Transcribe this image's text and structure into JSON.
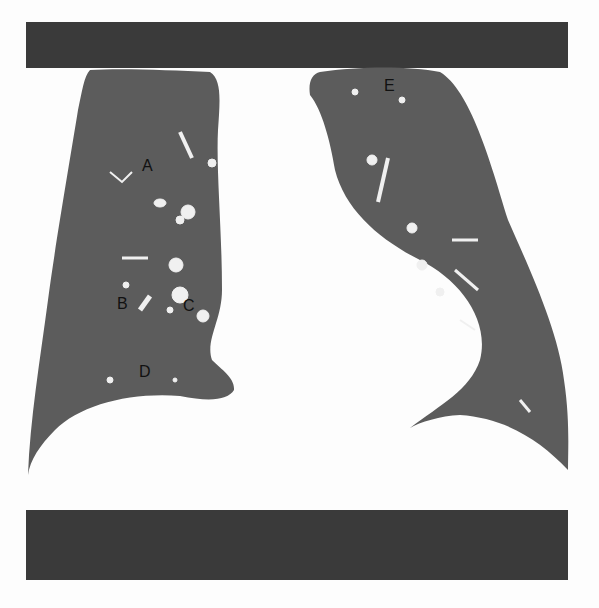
{
  "image": {
    "description": "Coronal CT lung window showing right and left lungs with lettered regions",
    "colors": {
      "lung_parenchyma": "#5a5a5a",
      "background": "#fdfdfd",
      "bars": "#3a3a3a",
      "vessels": "#f2f2f2"
    }
  },
  "labels": {
    "A": "A",
    "B": "B",
    "C": "C",
    "D": "D",
    "E": "E"
  }
}
